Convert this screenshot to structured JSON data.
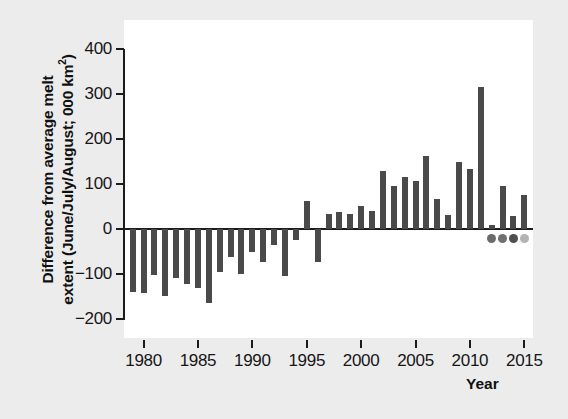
{
  "chart_data": {
    "type": "bar",
    "title": "",
    "xlabel": "Year",
    "ylabel_line1": "Difference from average melt",
    "ylabel_line2": "extent (June/July/August; 000 km²)",
    "ylabel": "Difference from average melt extent (June/July/August; 000 km²)",
    "ylim": [
      -200,
      400
    ],
    "xlim": [
      1978.2,
      2015.8
    ],
    "grid": false,
    "legend": false,
    "bar_color": "#4a4a4a",
    "axis_color": "#1c1c1c",
    "panel_color": "#ffffff",
    "background_color": "#ececed",
    "yticks": [
      400,
      300,
      200,
      100,
      0,
      -100,
      -200
    ],
    "ytick_labels": [
      "400",
      "300",
      "200",
      "100",
      "0",
      "−100",
      "−200"
    ],
    "xticks": [
      1980,
      1985,
      1990,
      1995,
      2000,
      2005,
      2010,
      2015
    ],
    "xtick_labels": [
      "1980",
      "1985",
      "1990",
      "1995",
      "2000",
      "2005",
      "2010",
      "2015"
    ],
    "categories": [
      1979,
      1980,
      1981,
      1982,
      1983,
      1984,
      1985,
      1986,
      1987,
      1988,
      1989,
      1990,
      1991,
      1992,
      1993,
      1994,
      1995,
      1996,
      1997,
      1998,
      1999,
      2000,
      2001,
      2002,
      2003,
      2004,
      2005,
      2006,
      2007,
      2008,
      2009,
      2010,
      2011,
      2012,
      2013,
      2014,
      2015
    ],
    "values": [
      -140,
      -143,
      -102,
      -148,
      -109,
      -122,
      -131,
      -165,
      -96,
      -62,
      -99,
      -51,
      -74,
      -36,
      -104,
      -24,
      63,
      -73,
      33,
      37,
      33,
      52,
      41,
      129,
      96,
      116,
      107,
      162,
      67,
      32,
      148,
      133,
      315,
      10,
      96,
      28,
      76
    ],
    "dots": [
      {
        "year": 2012,
        "color": "#6b6b6b",
        "value": -22
      },
      {
        "year": 2013,
        "color": "#707070",
        "value": -22
      },
      {
        "year": 2014,
        "color": "#4f4f4f",
        "value": -22
      },
      {
        "year": 2015,
        "color": "#b3b3b3",
        "value": -22
      }
    ]
  }
}
